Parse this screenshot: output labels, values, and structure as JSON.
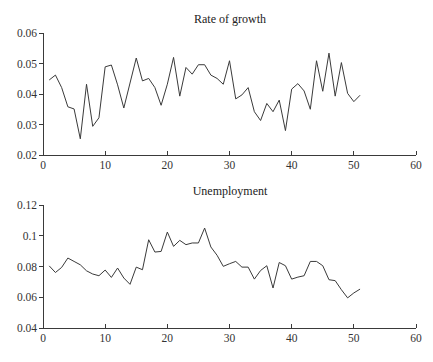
{
  "chart_data": [
    {
      "type": "line",
      "title": "Rate of growth",
      "xlabel": "",
      "ylabel": "",
      "xlim": [
        0,
        60
      ],
      "ylim": [
        0.02,
        0.06
      ],
      "grid": false,
      "legend": null,
      "x_ticks": [
        "0",
        "10",
        "20",
        "30",
        "40",
        "50",
        "60"
      ],
      "y_ticks": [
        "0.02",
        "0.03",
        "0.04",
        "0.05",
        "0.06"
      ],
      "x": [
        1,
        2,
        3,
        4,
        5,
        6,
        7,
        8,
        9,
        10,
        11,
        12,
        13,
        14,
        15,
        16,
        17,
        18,
        19,
        20,
        21,
        22,
        23,
        24,
        25,
        26,
        27,
        28,
        29,
        30,
        31,
        32,
        33,
        34,
        35,
        36,
        37,
        38,
        39,
        40,
        41,
        42,
        43,
        44,
        45,
        46,
        47,
        48,
        49,
        50,
        51
      ],
      "values": [
        0.0446,
        0.0462,
        0.0421,
        0.0358,
        0.0351,
        0.0253,
        0.0432,
        0.0294,
        0.0322,
        0.0489,
        0.0495,
        0.043,
        0.0354,
        0.0436,
        0.0518,
        0.0443,
        0.0451,
        0.0421,
        0.0363,
        0.0432,
        0.052,
        0.0393,
        0.0487,
        0.0465,
        0.0496,
        0.0496,
        0.0462,
        0.0451,
        0.0432,
        0.0509,
        0.0384,
        0.0397,
        0.0421,
        0.0342,
        0.0313,
        0.0369,
        0.0342,
        0.038,
        0.028,
        0.0416,
        0.0434,
        0.041,
        0.035,
        0.0509,
        0.0409,
        0.0534,
        0.0393,
        0.0503,
        0.0402,
        0.0375,
        0.0396
      ]
    },
    {
      "type": "line",
      "title": "Unemployment",
      "xlabel": "",
      "ylabel": "",
      "xlim": [
        0,
        60
      ],
      "ylim": [
        0.04,
        0.12
      ],
      "grid": false,
      "legend": null,
      "x_ticks": [
        "0",
        "10",
        "20",
        "30",
        "40",
        "50",
        "60"
      ],
      "y_ticks": [
        "0.04",
        "0.06",
        "0.08",
        "0.1",
        "0.12"
      ],
      "x": [
        1,
        2,
        3,
        4,
        5,
        6,
        7,
        8,
        9,
        10,
        11,
        12,
        13,
        14,
        15,
        16,
        17,
        18,
        19,
        20,
        21,
        22,
        23,
        24,
        25,
        26,
        27,
        28,
        29,
        30,
        31,
        32,
        33,
        34,
        35,
        36,
        37,
        38,
        39,
        40,
        41,
        42,
        43,
        44,
        45,
        46,
        47,
        48,
        49,
        50,
        51
      ],
      "values": [
        0.0804,
        0.0761,
        0.0794,
        0.0855,
        0.0833,
        0.0811,
        0.0772,
        0.0751,
        0.074,
        0.0777,
        0.0729,
        0.079,
        0.0725,
        0.0684,
        0.0796,
        0.0779,
        0.0974,
        0.0894,
        0.0898,
        0.1024,
        0.0931,
        0.097,
        0.0942,
        0.0953,
        0.0953,
        0.105,
        0.0927,
        0.0873,
        0.0801,
        0.0818,
        0.0833,
        0.0796,
        0.0796,
        0.0718,
        0.0774,
        0.0805,
        0.066,
        0.0826,
        0.0805,
        0.0718,
        0.0731,
        0.074,
        0.0833,
        0.0833,
        0.0805,
        0.0714,
        0.0708,
        0.0649,
        0.0596,
        0.0628,
        0.0653
      ]
    }
  ]
}
